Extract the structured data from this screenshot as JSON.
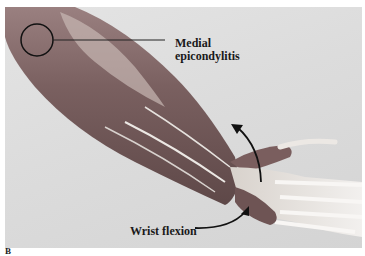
{
  "figure": {
    "panel_label": "B",
    "annotations": [
      {
        "id": "medial",
        "lines": [
          "Medial",
          "epicondylitis"
        ]
      },
      {
        "id": "wrist",
        "text": "Wrist flexion"
      }
    ],
    "colors": {
      "background": "#dcdcdc",
      "muscle": "#8a6a6a",
      "tendon": "#e8e4e0",
      "text": "#1a1a1a",
      "circle": "#111111"
    }
  }
}
